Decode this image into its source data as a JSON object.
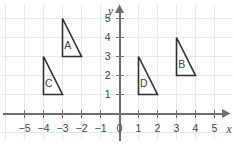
{
  "chart_data": {
    "type": "scatter",
    "title": "",
    "xlabel": "x",
    "ylabel": "y",
    "xlim": [
      -5.8,
      5.8
    ],
    "ylim": [
      -0.7,
      5.6
    ],
    "grid": true,
    "legend_position": "none",
    "x_ticks": [
      -5,
      -4,
      -3,
      -2,
      -1,
      0,
      1,
      2,
      3,
      4,
      5
    ],
    "x_tick_labels": [
      "−5",
      "−4",
      "−3",
      "−2",
      "−1",
      "0",
      "1",
      "2",
      "3",
      "4",
      "5"
    ],
    "y_ticks": [
      1,
      2,
      3,
      4,
      5
    ],
    "y_tick_labels": [
      "1",
      "2",
      "3",
      "4",
      "5"
    ],
    "origin_label": "0",
    "shapes": [
      {
        "label": "A",
        "kind": "right-triangle",
        "vertices": [
          [
            -3,
            5
          ],
          [
            -3,
            3
          ],
          [
            -2,
            3
          ]
        ],
        "label_point": [
          -2.72,
          3.62
        ]
      },
      {
        "label": "B",
        "kind": "right-triangle",
        "vertices": [
          [
            3,
            4
          ],
          [
            3,
            2
          ],
          [
            4,
            2
          ]
        ],
        "label_point": [
          3.28,
          2.62
        ]
      },
      {
        "label": "C",
        "kind": "right-triangle",
        "vertices": [
          [
            -4,
            3
          ],
          [
            -4,
            1
          ],
          [
            -3,
            1
          ]
        ],
        "label_point": [
          -3.72,
          1.62
        ]
      },
      {
        "label": "D",
        "kind": "right-triangle",
        "vertices": [
          [
            1,
            3
          ],
          [
            1,
            1
          ],
          [
            2,
            1
          ]
        ],
        "label_point": [
          1.28,
          1.62
        ]
      }
    ],
    "colors": {
      "background": "#ffffff",
      "grid": "#e9e9ec",
      "axis": "#6e6e72",
      "shape_stroke": "#2f2f33",
      "text": "#3f3f45"
    }
  }
}
